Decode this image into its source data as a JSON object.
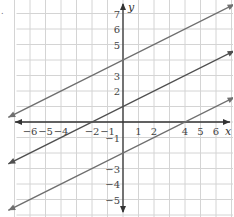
{
  "marker": ".",
  "chart_data": {
    "type": "line",
    "title": "",
    "xlabel": "x",
    "ylabel": "y",
    "xlim": [
      -7,
      7
    ],
    "ylim": [
      -6,
      8
    ],
    "grid": true,
    "x_ticks": [
      -6,
      -5,
      -4,
      -2,
      -1,
      1,
      2,
      4,
      5,
      6
    ],
    "y_ticks": [
      7,
      6,
      5,
      3,
      2,
      -1,
      -3,
      -4,
      -5
    ],
    "x_tick_labels": [
      "−6",
      "−5",
      "−4",
      "−2",
      "−1",
      "1",
      "2",
      "4",
      "5",
      "6"
    ],
    "y_tick_labels": [
      "7",
      "6",
      "5",
      "3",
      "2",
      "−1",
      "−3",
      "−4",
      "−5"
    ],
    "series": [
      {
        "name": "upper line",
        "equation": "y = 0.5x + 4",
        "slope": 0.5,
        "intercept": 4,
        "x": [
          -7.4,
          7.2
        ],
        "y": [
          0.3,
          7.6
        ],
        "color": "#707070"
      },
      {
        "name": "middle line",
        "equation": "y = 0.5x + 1",
        "slope": 0.5,
        "intercept": 1,
        "x": [
          -7.4,
          7.2
        ],
        "y": [
          -2.7,
          4.6
        ],
        "color": "#505050"
      },
      {
        "name": "lower line",
        "equation": "y = 0.5x - 2",
        "slope": 0.5,
        "intercept": -2,
        "x": [
          -7.4,
          7.2
        ],
        "y": [
          -5.7,
          1.6
        ],
        "color": "#707070"
      }
    ],
    "colors": {
      "grid": "#d4d4d4",
      "axis": "#333333"
    }
  }
}
